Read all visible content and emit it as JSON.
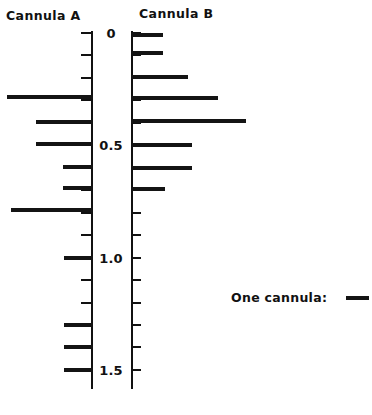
{
  "figure": {
    "panel_a_title": "Cannula A",
    "panel_b_title": "Cannula B",
    "legend_label": "One cannula:",
    "legend_swatch_name": "cannula-line-swatch"
  },
  "axis": {
    "labels": [
      "0",
      "0.5",
      "1.0",
      "1.5"
    ],
    "label_values": [
      0,
      0.5,
      1.0,
      1.5
    ],
    "tick_interval": 0.1,
    "range": [
      0,
      1.58
    ],
    "orientation": "vertical-down"
  },
  "chart_data": {
    "type": "bar",
    "orientation": "horizontal",
    "title": "",
    "subtitle": "",
    "xlabel": "",
    "ylabel": "",
    "ylim": [
      0,
      1.58
    ],
    "grid": false,
    "legend": {
      "position": "right",
      "entries": [
        "One cannula:"
      ]
    },
    "axis_ticks_major": [
      0,
      0.5,
      1.0,
      1.5
    ],
    "axis_tick_labels": [
      "0",
      "0.5",
      "1.0",
      "1.5"
    ],
    "axis_ticks_minor_interval": 0.1,
    "note": "Each horizontal line represents one cannula plotted at its depth value; line length is nominal (one cannula per line).",
    "series": [
      {
        "name": "Cannula A",
        "direction": "left",
        "values": [
          0.285,
          0.395,
          0.495,
          0.595,
          0.69,
          0.79,
          1.0,
          1.3,
          1.4,
          1.5
        ],
        "bar_lengths_px": [
          86,
          57,
          57,
          30,
          30,
          82,
          29,
          29,
          29,
          29
        ]
      },
      {
        "name": "Cannula B",
        "direction": "right",
        "values": [
          0.01,
          0.09,
          0.195,
          0.29,
          0.39,
          0.5,
          0.6,
          0.695
        ],
        "bar_lengths_px": [
          32,
          32,
          57,
          87,
          115,
          61,
          61,
          34
        ]
      }
    ]
  }
}
